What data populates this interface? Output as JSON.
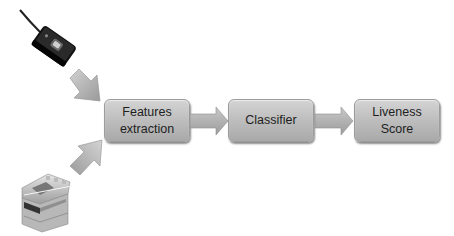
{
  "diagram": {
    "type": "flowchart",
    "inputs": [
      {
        "id": "fingerprint-reader",
        "label": "",
        "icon": "fingerprint-reader-icon"
      },
      {
        "id": "flatbed-scanner",
        "label": "",
        "icon": "scanner-icon"
      }
    ],
    "nodes": [
      {
        "id": "features-extraction",
        "label": "Features\nextraction"
      },
      {
        "id": "classifier",
        "label": "Classifier"
      },
      {
        "id": "liveness-score",
        "label": "Liveness\nScore"
      }
    ],
    "edges": [
      {
        "from": "fingerprint-reader",
        "to": "features-extraction"
      },
      {
        "from": "flatbed-scanner",
        "to": "features-extraction"
      },
      {
        "from": "features-extraction",
        "to": "classifier"
      },
      {
        "from": "classifier",
        "to": "liveness-score"
      }
    ],
    "colors": {
      "box_top": "#d4d4d4",
      "box_bottom": "#a9a9a9",
      "arrow": "#b0b0b0",
      "text": "#1e1e1e",
      "background": "#ffffff"
    }
  }
}
